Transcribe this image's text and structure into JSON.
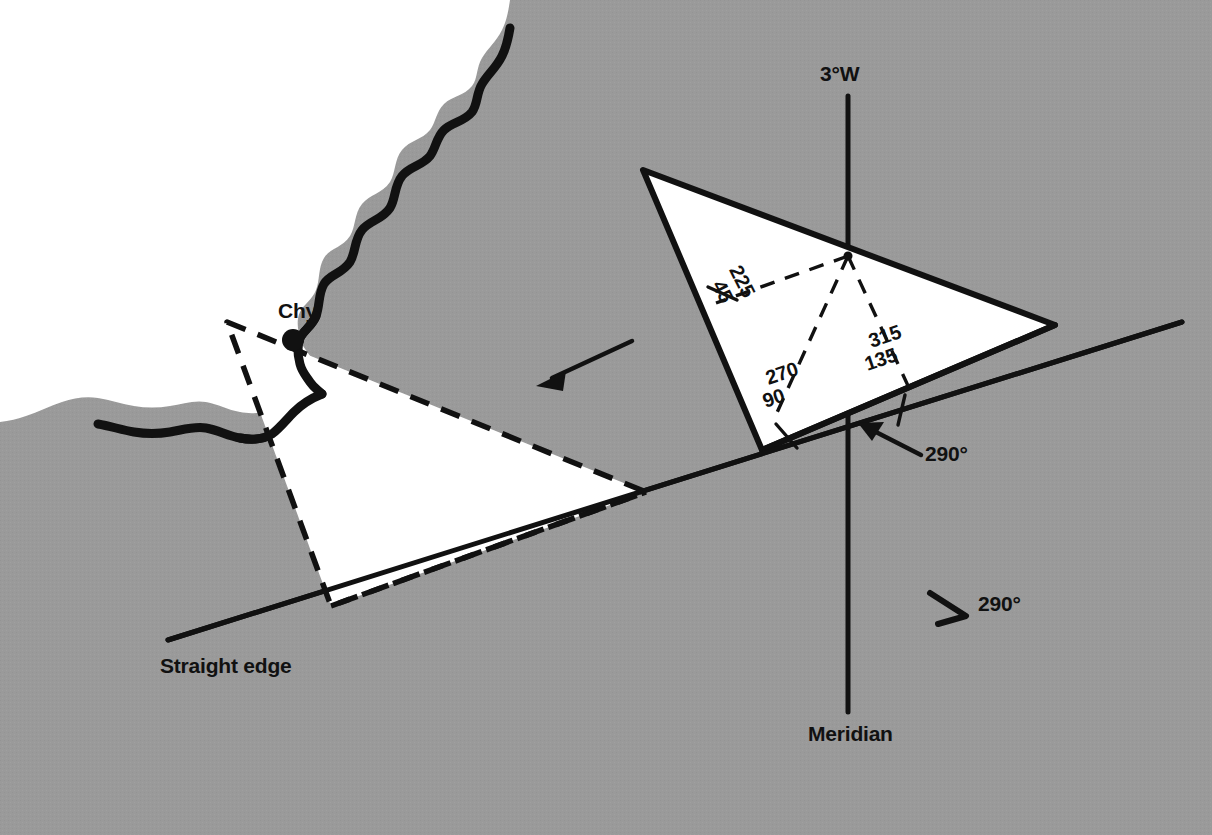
{
  "figure": {
    "kind": "navigation-plotting-diagram",
    "sea_color": "#ffffff",
    "land_color": "#9a9a9a",
    "ink_color": "#111111"
  },
  "labels": {
    "magnetic_variation": "3°W",
    "chimney": "Chy",
    "straight_edge": "Straight edge",
    "meridian": "Meridian",
    "bearing_on_edge": "290°",
    "bearing_direction": "290°"
  },
  "protractor": {
    "scale_marks": [
      {
        "outer": "225",
        "inner": "45"
      },
      {
        "outer": "270",
        "inner": "90"
      },
      {
        "outer": "315",
        "inner": "135"
      }
    ],
    "labels_flat": [
      "225",
      "45",
      "270",
      "90",
      "315",
      "135"
    ]
  },
  "geometry": {
    "protractor_solid": {
      "apex_top_left": [
        643,
        170
      ],
      "vertex_right": [
        1055,
        325
      ],
      "vertex_bottom_left": [
        762,
        450
      ],
      "centre": [
        848,
        256
      ]
    },
    "protractor_dashed": {
      "apex_top": [
        227,
        322
      ],
      "vertex_right": [
        646,
        492
      ],
      "vertex_bottom_left": [
        331,
        606
      ]
    },
    "straight_edge": {
      "from": [
        168,
        640
      ],
      "to": [
        1182,
        322
      ]
    },
    "meridian": {
      "from": [
        848,
        96
      ],
      "to": [
        848,
        712
      ]
    },
    "move_arrow": {
      "from": [
        632,
        341
      ],
      "to": [
        538,
        385
      ]
    },
    "bearing_pointer": {
      "from": [
        918,
        452
      ],
      "to": [
        862,
        424
      ]
    }
  },
  "icons": {
    "chimney_marker": "filled-dot-icon",
    "move_arrow": "arrow-left-icon",
    "bearing_arrow": "arrow-up-left-icon",
    "direction_arrow": "arrow-down-right-icon"
  }
}
